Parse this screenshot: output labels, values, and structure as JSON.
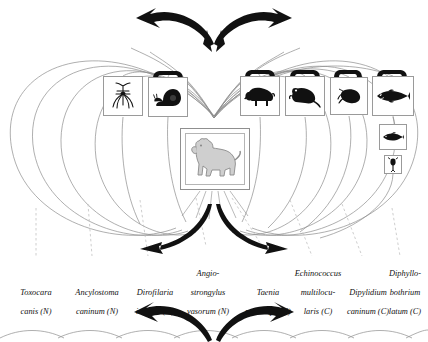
{
  "diagram": {
    "center_host": {
      "name": "dog",
      "icon": "dog-icon"
    },
    "stroke_colors": {
      "ellipse": "#8c8c8c",
      "box_border": "#9a9a9a",
      "arrow": "#111111",
      "leader_dashed": "#bdbdbd",
      "animal_fill": "#111111",
      "dog_fill": "#cfcfcf"
    },
    "intermediate_hosts": [
      {
        "id": "mosquito",
        "icon": "mosquito-icon",
        "x": 103,
        "y": 76,
        "w": 40,
        "h": 40,
        "segbar": false
      },
      {
        "id": "snail",
        "icon": "snail-icon",
        "x": 148,
        "y": 77,
        "w": 40,
        "h": 40,
        "segbar": true
      },
      {
        "id": "sheep",
        "icon": "sheep-icon",
        "x": 240,
        "y": 76,
        "w": 40,
        "h": 40,
        "segbar": true
      },
      {
        "id": "rodent",
        "icon": "rodent-icon",
        "x": 285,
        "y": 76,
        "w": 40,
        "h": 40,
        "segbar": true
      },
      {
        "id": "flea",
        "icon": "flea-icon",
        "x": 330,
        "y": 77,
        "w": 38,
        "h": 38,
        "segbar": true
      },
      {
        "id": "pike",
        "icon": "pike-fish-icon",
        "x": 372,
        "y": 76,
        "w": 42,
        "h": 40,
        "segbar": true
      },
      {
        "id": "small-fish",
        "icon": "small-fish-icon",
        "x": 379,
        "y": 124,
        "w": 28,
        "h": 26,
        "segbar": false
      },
      {
        "id": "copepod",
        "icon": "copepod-icon",
        "x": 384,
        "y": 155,
        "w": 18,
        "h": 19,
        "segbar": false
      }
    ],
    "dog_box": {
      "x": 180,
      "y": 128,
      "w": 70,
      "h": 62
    },
    "arrows": {
      "top": {
        "label": "ingestion-arrows-converging",
        "direction": "down-converging"
      },
      "bottom": {
        "label": "shedding-arrows-diverging",
        "direction": "outward-diverging"
      }
    },
    "parasites": [
      {
        "id": "toxocara-canis",
        "line1": "Toxocara",
        "line2": "canis (N)",
        "line0": "",
        "cx": 36,
        "leader_x": 36,
        "leader_top": 208
      },
      {
        "id": "ancylostoma-caninum",
        "line1": "Ancylostoma",
        "line2": "caninum (N)",
        "line0": "",
        "cx": 97,
        "leader_x": 90,
        "leader_top": 204
      },
      {
        "id": "dirofilaria-immitis",
        "line1": "Dirofilaria",
        "line2": "immitis (N)",
        "line0": "",
        "cx": 154,
        "leader_x": 146,
        "leader_top": 200
      },
      {
        "id": "angiostrongylus-vasorum",
        "line1": "strongylus",
        "line2": "vasorum (N)",
        "line0": "Angio-",
        "cx": 208,
        "leader_x": 204,
        "leader_top": 198
      },
      {
        "id": "taenia-multiceps",
        "line1": "Taenia",
        "line2": "multiceps (C)",
        "line0": "",
        "cx": 268,
        "leader_x": 268,
        "leader_top": 198
      },
      {
        "id": "echinococcus-multilocularis",
        "line1": "multilocu-",
        "line2": "laris (C)",
        "line0": "Echinococcus",
        "cx": 318,
        "leader_x": 318,
        "leader_top": 200
      },
      {
        "id": "dipylidium-caninum",
        "line1": "Dipylidium",
        "line2": "caninum (C)",
        "line0": "",
        "cx": 367,
        "leader_x": 367,
        "leader_top": 204
      },
      {
        "id": "diphyllobothrium-latum",
        "line1": "bothrium",
        "line2": "latum (C)",
        "line0": "Diphyllo-",
        "cx": 408,
        "leader_x": 404,
        "leader_top": 208
      }
    ]
  }
}
